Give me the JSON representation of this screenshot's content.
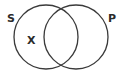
{
  "diagram": {
    "type": "venn",
    "sets": [
      {
        "label": "S",
        "cx": 46,
        "cy": 37,
        "r": 32
      },
      {
        "label": "P",
        "cx": 76,
        "cy": 37,
        "r": 32
      }
    ],
    "labels": {
      "set_s": "S",
      "set_p": "P",
      "marker": "X"
    },
    "marker_region": "S only (S and not P)",
    "stroke_color": "#3a3a3a",
    "text_color": "#2b2b2b"
  }
}
